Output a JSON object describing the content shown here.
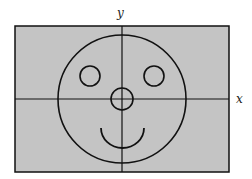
{
  "diagram": {
    "title": "",
    "axes": {
      "x_label": "x",
      "y_label": "y"
    },
    "colors": {
      "background": "#c4c4c4",
      "stroke": "#111111",
      "page": "#ffffff"
    },
    "shapes": [
      {
        "name": "face",
        "type": "circle",
        "cx": 122,
        "cy": 99,
        "r": 64
      },
      {
        "name": "left-eye",
        "type": "circle",
        "cx": 90,
        "cy": 76,
        "r": 10
      },
      {
        "name": "right-eye",
        "type": "circle",
        "cx": 154,
        "cy": 76,
        "r": 10
      },
      {
        "name": "nose",
        "type": "circle",
        "cx": 122,
        "cy": 99,
        "r": 11
      },
      {
        "name": "smile",
        "type": "arc",
        "from": [
          101,
          128
        ],
        "to": [
          144,
          128
        ],
        "depth": 20
      }
    ]
  }
}
